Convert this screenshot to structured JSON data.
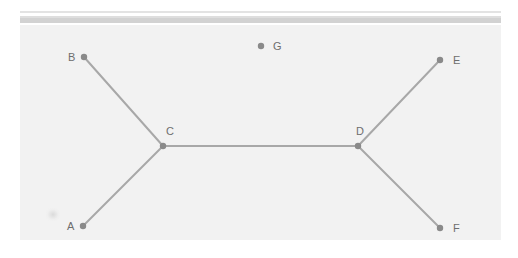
{
  "canvas": {
    "width": 518,
    "height": 258,
    "background": "#ffffff",
    "panel_background": "#f2f2f2"
  },
  "scrollbar": {
    "name": "horizontal-scroll-strip",
    "track_color": "#e3e3e3",
    "thumb_color": "#d2d2d2"
  },
  "chart_data": {
    "type": "diagram",
    "subtype": "node-link-graph",
    "title": "",
    "node_color": "#8a8a8a",
    "edge_color": "#a8a8a8",
    "label_color": "#6e6e6e",
    "node_radius": 3.2,
    "edge_width": 2,
    "nodes": [
      {
        "id": "A",
        "label": "A",
        "x": 63,
        "y": 201,
        "label_dx": -16,
        "label_dy": 0
      },
      {
        "id": "B",
        "label": "B",
        "x": 64,
        "y": 32,
        "label_dx": -16,
        "label_dy": 0
      },
      {
        "id": "C",
        "label": "C",
        "x": 143,
        "y": 121,
        "label_dx": 3,
        "label_dy": -15
      },
      {
        "id": "D",
        "label": "D",
        "x": 338,
        "y": 121,
        "label_dx": -2,
        "label_dy": -15
      },
      {
        "id": "E",
        "label": "E",
        "x": 420,
        "y": 35,
        "label_dx": 13,
        "label_dy": 0
      },
      {
        "id": "F",
        "label": "F",
        "x": 420,
        "y": 203,
        "label_dx": 13,
        "label_dy": 0
      },
      {
        "id": "G",
        "label": "G",
        "x": 241,
        "y": 21,
        "label_dx": 12,
        "label_dy": 0
      }
    ],
    "edges": [
      {
        "from": "B",
        "to": "C"
      },
      {
        "from": "A",
        "to": "C"
      },
      {
        "from": "C",
        "to": "D"
      },
      {
        "from": "D",
        "to": "E"
      },
      {
        "from": "D",
        "to": "F"
      }
    ],
    "isolated_nodes": [
      "G"
    ],
    "node_count": 7,
    "edge_count": 5
  }
}
